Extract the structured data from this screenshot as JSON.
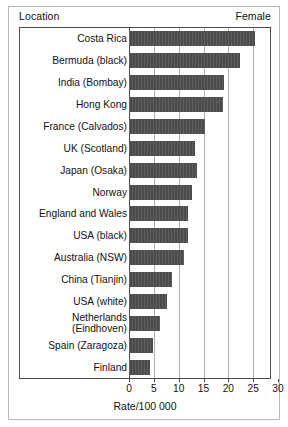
{
  "header": {
    "left_label": "Location",
    "right_label": "Female"
  },
  "chart_data": {
    "type": "bar",
    "orientation": "horizontal",
    "title": "",
    "xlabel": "Rate/100 000",
    "ylabel": "Location",
    "series_name": "Female",
    "xlim": [
      0,
      30
    ],
    "xticks": [
      0,
      5,
      10,
      15,
      20,
      25,
      30
    ],
    "xtick_labels": [
      "0",
      "5",
      "10",
      "15",
      "20",
      "25",
      "30"
    ],
    "grid": true,
    "grid_axis": "x",
    "legend": false,
    "bar_color": "#4b4b4b",
    "categories": [
      "Costa Rica",
      "Bermuda (black)",
      "India (Bombay)",
      "Hong Kong",
      "France (Calvados)",
      "UK (Scotland)",
      "Japan (Osaka)",
      "Norway",
      "England and Wales",
      "USA (black)",
      "Australia (NSW)",
      "China (Tianjin)",
      "USA (white)",
      "Netherlands (Eindhoven)",
      "Spain (Zaragoza)",
      "Finland"
    ],
    "category_lines": [
      [
        "Costa Rica"
      ],
      [
        "Bermuda (black)"
      ],
      [
        "India (Bombay)"
      ],
      [
        "Hong Kong"
      ],
      [
        "France (Calvados)"
      ],
      [
        "UK (Scotland)"
      ],
      [
        "Japan (Osaka)"
      ],
      [
        "Norway"
      ],
      [
        "England and Wales"
      ],
      [
        "USA (black)"
      ],
      [
        "Australia (NSW)"
      ],
      [
        "China (Tianjin)"
      ],
      [
        "USA (white)"
      ],
      [
        "Netherlands",
        "(Eindhoven)"
      ],
      [
        "Spain (Zaragoza)"
      ],
      [
        "Finland"
      ]
    ],
    "values": [
      25.4,
      22.3,
      19.1,
      18.9,
      15.3,
      13.2,
      13.6,
      12.7,
      11.9,
      11.9,
      11.1,
      8.6,
      7.6,
      6.3,
      4.8,
      4.2
    ]
  }
}
